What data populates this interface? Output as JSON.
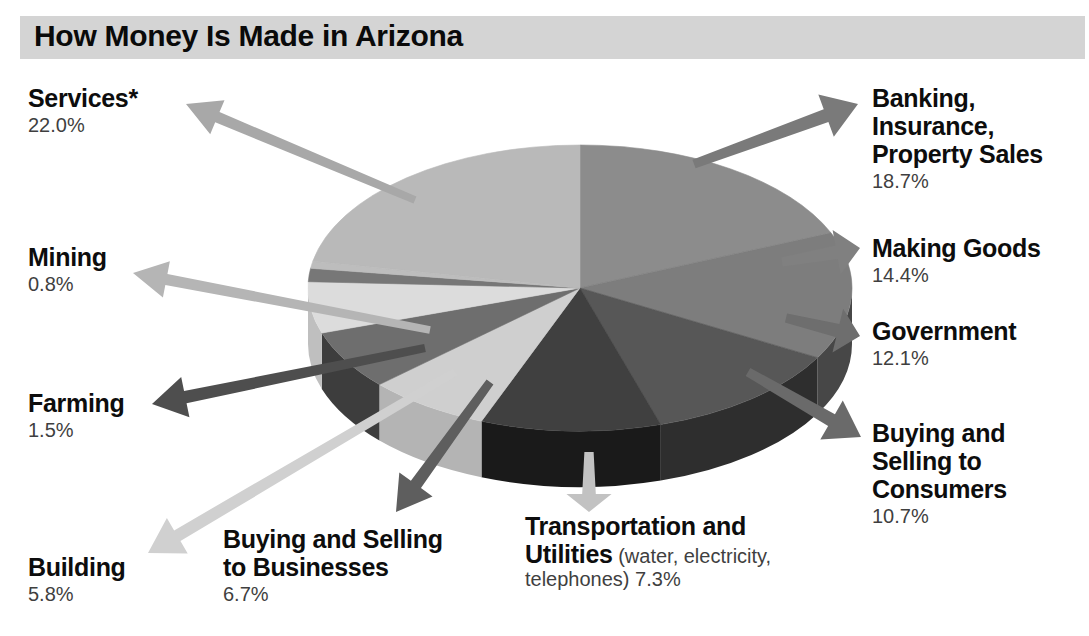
{
  "title": "How Money Is Made in Arizona",
  "colors": {
    "title_band": "#d4d4d4",
    "page_background": "#ffffff",
    "label_text": "#0d0d0d",
    "percent_text": "#3f3f3f"
  },
  "labels": {
    "services": {
      "name": "Services*",
      "pct": "22.0%"
    },
    "mining": {
      "name": "Mining",
      "pct": "0.8%"
    },
    "farming": {
      "name": "Farming",
      "pct": "1.5%"
    },
    "building": {
      "name": "Building",
      "pct": "5.8%"
    },
    "buying_selling_businesses": {
      "name_line1": "Buying and Selling",
      "name_line2": "to Businesses",
      "pct": "6.7%"
    },
    "transportation": {
      "name_line1": "Transportation and",
      "name_line2": "Utilities",
      "note1": " (water, electricity,",
      "note2": "telephones) ",
      "pct": "7.3%"
    },
    "banking": {
      "name_line1": "Banking,",
      "name_line2": "Insurance,",
      "name_line3": "Property Sales",
      "pct": "18.7%"
    },
    "making_goods": {
      "name": "Making Goods",
      "pct": "14.4%"
    },
    "government": {
      "name": "Government",
      "pct": "12.1%"
    },
    "buying_selling_consumers": {
      "name_line1": "Buying and",
      "name_line2": "Selling to",
      "name_line3": "Consumers",
      "pct": "10.7%"
    }
  },
  "chart_data": {
    "type": "pie",
    "title": "How Money Is Made in Arizona",
    "style": "3d-pie",
    "units": "percent of state economy",
    "total": 100.0,
    "categories": [
      "Services*",
      "Banking, Insurance, Property Sales",
      "Making Goods",
      "Government",
      "Buying and Selling to Consumers",
      "Transportation and Utilities (water, electricity, telephones)",
      "Buying and Selling to Businesses",
      "Building",
      "Farming",
      "Mining"
    ],
    "values": [
      22.0,
      18.7,
      14.4,
      12.1,
      10.7,
      7.3,
      6.7,
      5.8,
      1.5,
      0.8
    ],
    "slices": [
      {
        "label": "Banking, Insurance, Property Sales",
        "value": 18.7,
        "color": "#8c8c8c",
        "side_color": "#4f4f4f",
        "arrow_color": "#7a7a7a"
      },
      {
        "label": "Making Goods",
        "value": 14.4,
        "color": "#7d7d7d",
        "side_color": "#474747",
        "arrow_color": "#808080"
      },
      {
        "label": "Government",
        "value": 12.1,
        "color": "#575757",
        "side_color": "#2e2e2e",
        "arrow_color": "#6e6e6e"
      },
      {
        "label": "Buying and Selling to Consumers",
        "value": 10.7,
        "color": "#404040",
        "side_color": "#1a1a1a",
        "arrow_color": "#6a6a6a"
      },
      {
        "label": "Transportation and Utilities",
        "value": 7.3,
        "color": "#cfcfcf",
        "side_color": "#b4b4b4",
        "arrow_color": "#c2c2c2"
      },
      {
        "label": "Buying and Selling to Businesses",
        "value": 6.7,
        "color": "#6e6e6e",
        "side_color": "#3d3d3d",
        "arrow_color": "#5e5e5e"
      },
      {
        "label": "Building",
        "value": 5.8,
        "color": "#dcdcdc",
        "side_color": "#bfbfbf",
        "arrow_color": "#d0d0d0"
      },
      {
        "label": "Farming",
        "value": 1.5,
        "color": "#777777",
        "side_color": "#424242",
        "arrow_color": "#4e4e4e"
      },
      {
        "label": "Mining",
        "value": 0.8,
        "color": "#bdbdbd",
        "side_color": "#9a9a9a",
        "arrow_color": "#b5b5b5"
      },
      {
        "label": "Services*",
        "value": 22.0,
        "color": "#b9b9b9",
        "side_color": "#8f8f8f",
        "arrow_color": "#a8a8a8"
      }
    ],
    "legend": "callout-labels",
    "grid": false
  }
}
